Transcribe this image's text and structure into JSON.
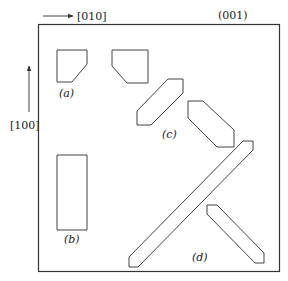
{
  "diagram": {
    "axes": {
      "horizontal": {
        "label": "[010]"
      },
      "vertical": {
        "label": "[100]"
      },
      "plane": {
        "label": "(001)"
      }
    },
    "colors": {
      "stroke": "#444444",
      "frame": "#333333",
      "text": "#222222"
    },
    "shapes": [
      {
        "id": "a",
        "label": "(a)",
        "points": "57,50 87,50 87,64 72,82 57,82"
      },
      {
        "id": "b",
        "label": "(b)",
        "points": "57,155 87,155 87,230 57,230"
      },
      {
        "id": "c1",
        "label": "",
        "points": "112,50 148,50 148,83 127,83 112,66"
      },
      {
        "id": "c2",
        "label": "(c)",
        "points": "168,79 183,79 183,93 151,125 137,125 137,111"
      },
      {
        "id": "c3",
        "label": "",
        "points": "188,101 203,101 234,130 234,147 217,147 188,118"
      },
      {
        "id": "d1",
        "label": "(d)",
        "points": "243,141 253,141 253,150 138,267 129,267 129,257"
      },
      {
        "id": "d2",
        "label": "",
        "points": "207,205 217,205 264,253 264,263 255,263 207,214"
      }
    ],
    "labels": {
      "a": "(a)",
      "b": "(b)",
      "c": "(c)",
      "d": "(d)"
    }
  }
}
